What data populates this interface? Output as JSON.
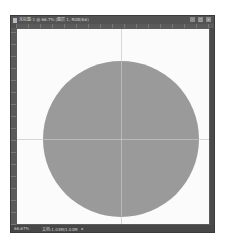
{
  "window": {
    "title": "未标题-1 @ 66.7% (图层 1, RGB/8#)",
    "controls": {
      "minimize": "–",
      "maximize": "□",
      "close": "×"
    }
  },
  "canvas": {
    "background": "#fbfbfb",
    "shape": {
      "type": "circle",
      "fill": "#9a9a9a",
      "center_x": 104,
      "center_y": 110,
      "radius": 78
    },
    "guides": {
      "vertical_x": 104,
      "horizontal_y": 110
    }
  },
  "statusbar": {
    "zoom": "66.67%",
    "doc_info": "文档:1.03M/1.03M",
    "menu_arrow": "▸"
  }
}
